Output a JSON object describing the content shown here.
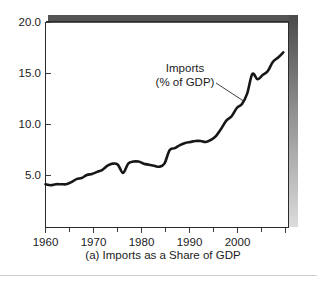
{
  "figure": {
    "caption": "(a) Imports as a Share of GDP",
    "annotation_line1": "Imports",
    "annotation_line2": "(% of GDP)",
    "line_color": "#171717",
    "axis_color": "#2b2b2b",
    "top_bar_color": "#555555",
    "shadow_top_color": "#4a4a4a",
    "shadow_bottom_color": "#d8d8d8",
    "background_color": "#ffffff"
  },
  "chart_data": {
    "type": "line",
    "title": "(a) Imports as a Share of GDP",
    "xlabel": "",
    "ylabel": "",
    "xlim": [
      1960,
      2007
    ],
    "ylim": [
      0.0,
      20.0
    ],
    "grid": false,
    "legend": "none",
    "annotations": [
      {
        "text": "Imports (% of GDP)",
        "x": 1995.5,
        "y": 13.2,
        "leader_to_x": 1998.0,
        "leader_to_y": 11.5
      }
    ],
    "ytick_labels": [
      "5.0",
      "10.0",
      "15.0",
      "20.0"
    ],
    "ytick_values": [
      5.0,
      10.0,
      15.0,
      20.0
    ],
    "xtick_labels": [
      "1960",
      "1970",
      "1980",
      "1990",
      "2000"
    ],
    "xtick_values": [
      1960,
      1970,
      1980,
      1990,
      2000
    ],
    "xtick_minor_values": [
      1965,
      1975,
      1985,
      1995,
      2005
    ],
    "series": [
      {
        "name": "Imports (% of GDP)",
        "x": [
          1960,
          1961,
          1962,
          1963,
          1964,
          1965,
          1966,
          1967,
          1968,
          1969,
          1970,
          1971,
          1972,
          1973,
          1974,
          1975,
          1976,
          1977,
          1978,
          1979,
          1980,
          1981,
          1982,
          1983,
          1984,
          1985,
          1986,
          1987,
          1988,
          1989,
          1990,
          1991,
          1992,
          1993,
          1994,
          1995,
          1996,
          1997,
          1998,
          1999,
          2000,
          2001,
          2002,
          2003,
          2004,
          2005,
          2006
        ],
        "values": [
          4.2,
          4.1,
          4.2,
          4.2,
          4.2,
          4.4,
          4.7,
          4.8,
          5.1,
          5.2,
          5.4,
          5.6,
          6.0,
          6.2,
          6.1,
          5.3,
          6.2,
          6.4,
          6.4,
          6.2,
          6.1,
          6.0,
          5.9,
          6.2,
          7.5,
          7.7,
          8.0,
          8.2,
          8.3,
          8.4,
          8.4,
          8.3,
          8.5,
          8.9,
          9.6,
          10.4,
          10.8,
          11.6,
          12.0,
          13.0,
          14.9,
          14.4,
          14.8,
          15.2,
          16.1,
          16.5,
          17.0
        ]
      }
    ]
  }
}
